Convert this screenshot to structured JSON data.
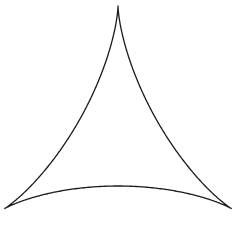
{
  "figure": {
    "shape": "deltoid",
    "stroke_color": "#1a1a1a",
    "background_color": "#ffffff",
    "cusps": [
      {
        "name": "top",
        "x": 118,
        "y": 6
      },
      {
        "name": "bottom-left",
        "x": 7,
        "y": 213
      },
      {
        "name": "bottom-right",
        "x": 234,
        "y": 212
      }
    ],
    "center": {
      "x": 118,
      "y": 141
    },
    "scale": {
      "sx": 43.6,
      "sy": 45
    }
  }
}
